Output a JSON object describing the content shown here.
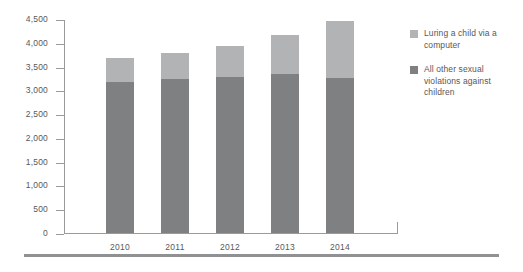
{
  "chart_data": {
    "type": "bar",
    "stacked": true,
    "title": "",
    "subtitle": "",
    "xlabel": "",
    "ylabel": "",
    "categories": [
      "2010",
      "2011",
      "2012",
      "2013",
      "2014"
    ],
    "series": [
      {
        "name": "All other sexual violations against children",
        "color": "#7f8081",
        "values": [
          3170,
          3230,
          3290,
          3340,
          3270
        ]
      },
      {
        "name": "Luring a child via a computer",
        "color": "#b2b3b4",
        "values": [
          520,
          560,
          650,
          830,
          1190
        ]
      }
    ],
    "totals": [
      3690,
      3790,
      3940,
      4170,
      4460
    ],
    "ylim": [
      0,
      4500
    ],
    "yticks": [
      0,
      500,
      1000,
      1500,
      2000,
      2500,
      3000,
      3500,
      4000,
      4500
    ],
    "ytick_labels": [
      "0",
      "500",
      "1,000",
      "1,500",
      "2,000",
      "2,500",
      "3,000",
      "3,500",
      "4,000",
      "4,500"
    ],
    "grid": false,
    "legend_position": "right",
    "legend": [
      {
        "label": "Luring a child via a computer",
        "color": "#b2b3b4",
        "swatch_name": "legend-swatch-luring"
      },
      {
        "label": "All other sexual violations against children",
        "color": "#7f8081",
        "swatch_name": "legend-swatch-other"
      }
    ]
  }
}
